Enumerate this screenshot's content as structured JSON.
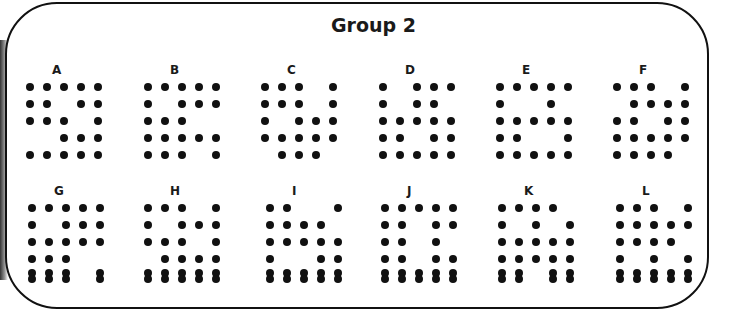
{
  "title": "Group 2",
  "panels": [
    {
      "label": "A",
      "rows": [
        "11111",
        "11011",
        "11101",
        "00111",
        "11111"
      ],
      "doubled_last_row": false
    },
    {
      "label": "B",
      "rows": [
        "11111",
        "10111",
        "11100",
        "11111",
        "11101"
      ],
      "doubled_last_row": false
    },
    {
      "label": "C",
      "rows": [
        "11101",
        "11101",
        "10111",
        "11111",
        "01110"
      ],
      "doubled_last_row": false
    },
    {
      "label": "D",
      "rows": [
        "10111",
        "10110",
        "11111",
        "11011",
        "11111"
      ],
      "doubled_last_row": false
    },
    {
      "label": "E",
      "rows": [
        "11111",
        "10010",
        "11111",
        "11001",
        "11111"
      ],
      "doubled_last_row": false
    },
    {
      "label": "F",
      "rows": [
        "11101",
        "01111",
        "11011",
        "11111",
        "11110"
      ],
      "doubled_last_row": false
    },
    {
      "label": "G",
      "rows": [
        "11111",
        "10111",
        "11111",
        "11100",
        "11101"
      ],
      "doubled_last_row": true
    },
    {
      "label": "H",
      "rows": [
        "11101",
        "10111",
        "11101",
        "01111",
        "11111"
      ],
      "doubled_last_row": true
    },
    {
      "label": "I",
      "rows": [
        "11001",
        "11110",
        "11111",
        "10011",
        "11111"
      ],
      "doubled_last_row": true
    },
    {
      "label": "J",
      "rows": [
        "11111",
        "11011",
        "11010",
        "11011",
        "11111"
      ],
      "doubled_last_row": true
    },
    {
      "label": "K",
      "rows": [
        "11110",
        "10101",
        "11111",
        "11111",
        "11011"
      ],
      "doubled_last_row": true
    },
    {
      "label": "L",
      "rows": [
        "11101",
        "11111",
        "11110",
        "10101",
        "11111"
      ],
      "doubled_last_row": true
    }
  ]
}
